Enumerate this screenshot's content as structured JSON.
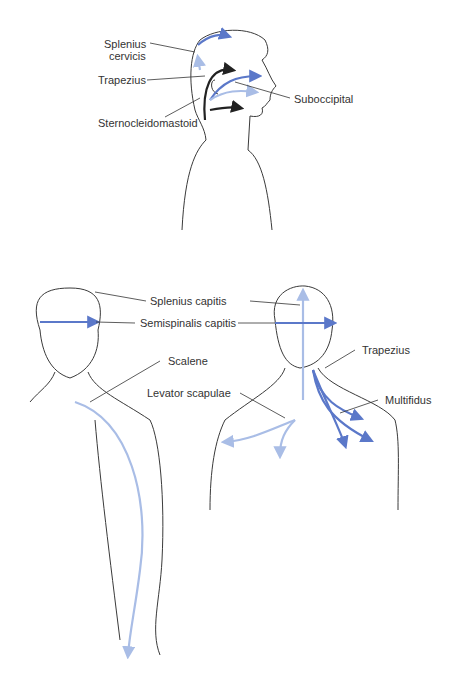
{
  "labels": {
    "splenius_cervicis_1": "Splenius",
    "splenius_cervicis_2": "cervicis",
    "trapezius_side": "Trapezius",
    "sternocleidomastoid": "Sternocleidomastoid",
    "suboccipital": "Suboccipital",
    "splenius_capitis": "Splenius capitis",
    "semispinalis_capitis": "Semispinalis capitis",
    "scalene": "Scalene",
    "trapezius_back": "Trapezius",
    "levator_scapulae": "Levator scapulae",
    "multifidus": "Multifidus"
  },
  "colors": {
    "outline": "#3a3a3a",
    "light_blue": "#a9bde6",
    "mid_blue": "#5b78c9",
    "dark": "#222222"
  }
}
